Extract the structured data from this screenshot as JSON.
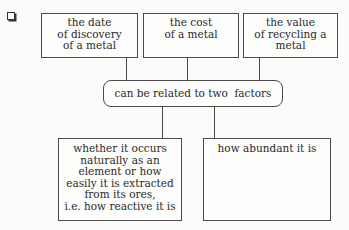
{
  "diagram": {
    "top_boxes": [
      {
        "text": "the date\nof discovery\nof a metal"
      },
      {
        "text": "the cost\nof a metal"
      },
      {
        "text": "the value\nof recycling a\nmetal"
      }
    ],
    "center_node": {
      "text": "can be related to two  factors"
    },
    "bottom_boxes": [
      {
        "text": "whether it occurs\nnaturally as an\nelement or how\neasily it is extracted\nfrom its ores,\ni.e. how reactive it is"
      },
      {
        "text": "how abundant it is"
      }
    ]
  }
}
